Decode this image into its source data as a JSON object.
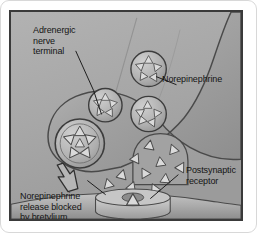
{
  "figure": {
    "type": "anatomical-illustration",
    "style": "grayscale pencil-shaded medical diagram",
    "border": {
      "outer_color": "#d8d8d8",
      "inner_color": "#3a3a3a"
    },
    "background_color": "#a9a9a9"
  },
  "labels": {
    "terminal": "Adrenergic\nnerve\nterminal",
    "norepinephrine": "Norepinephrine",
    "postsynaptic_receptor": "Postsynaptic\nreceptor",
    "blocked_release": "Norepinephrine\nrelease blocked\nby bretylium"
  },
  "colors": {
    "neuron_fill": "#9c9c9c",
    "neuron_fill_light": "#b8b8b8",
    "vesicle_fill": "#b4b4b4",
    "granule_fill": "#dadada",
    "outline": "#3c3c3c",
    "membrane_fill": "#b0b0b0",
    "text": "#141414"
  },
  "elements": {
    "vesicle_count": 4,
    "free_transmitter_count": 11,
    "receptor_count": 1,
    "arrow": "blocked-release-arrow"
  }
}
